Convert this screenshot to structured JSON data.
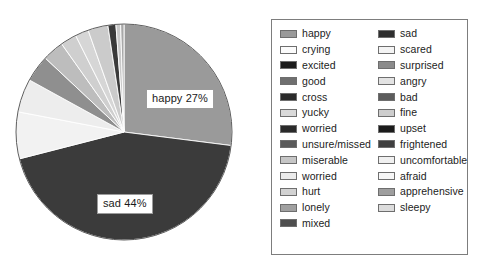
{
  "chart_data": {
    "type": "pie",
    "title": "",
    "xlabel": "",
    "ylabel": "",
    "legend_position": "right",
    "grid": false,
    "categories": [
      "happy",
      "sad",
      "crying",
      "scared",
      "excited",
      "surprised",
      "good",
      "angry",
      "cross",
      "bad",
      "yucky",
      "fine",
      "worried",
      "upset",
      "unsure/missed",
      "frightened",
      "miserable",
      "uncomfortable",
      "worried",
      "afraid",
      "hurt",
      "apprehensive",
      "lonely",
      "sleepy",
      "mixed"
    ],
    "values": [
      27,
      44,
      7,
      5,
      4,
      3,
      2.5,
      2,
      1.5,
      1.2,
      1,
      0.9,
      0.8,
      0.7,
      0.6,
      0.5,
      0.4,
      0.35,
      0.3,
      0.28,
      0.25,
      0.22,
      0.2,
      0.18,
      0.15
    ],
    "labels_shown": [
      {
        "text": "happy 27%",
        "category": "happy",
        "value": 27
      },
      {
        "text": "sad 44%",
        "category": "sad",
        "value": 44
      }
    ],
    "slices": [
      {
        "label": "happy",
        "percent": 27,
        "color": "#9a9a9a",
        "start_deg": 0,
        "end_deg": 97.2
      },
      {
        "label": "sad",
        "percent": 44,
        "color": "#3b3b3b",
        "start_deg": 97.2,
        "end_deg": 255.6
      },
      {
        "label": "crying",
        "percent": 7,
        "color": "#f2f2f2",
        "start_deg": 255.6,
        "end_deg": 280.8
      },
      {
        "label": "scared",
        "percent": 5,
        "color": "#ededed",
        "start_deg": 280.8,
        "end_deg": 298.8
      },
      {
        "label": "excited",
        "percent": 4,
        "color": "#8f8f8f",
        "start_deg": 298.8,
        "end_deg": 313.2
      },
      {
        "label": "surprised",
        "percent": 3.2,
        "color": "#bdbdbd",
        "start_deg": 313.2,
        "end_deg": 324.7
      },
      {
        "label": "good",
        "percent": 2.4,
        "color": "#cfcfcf",
        "start_deg": 324.7,
        "end_deg": 333.4
      },
      {
        "label": "angry",
        "percent": 2.0,
        "color": "#d6d6d6",
        "start_deg": 333.4,
        "end_deg": 340.6
      },
      {
        "label": "cross",
        "percent": 3.0,
        "color": "#cbcbcb",
        "start_deg": 340.6,
        "end_deg": 351.4
      },
      {
        "label": "bad",
        "percent": 1.2,
        "color": "#3a3a3a",
        "start_deg": 351.4,
        "end_deg": 355.7
      },
      {
        "label": "yucky",
        "percent": 0.7,
        "color": "#c9c9c9",
        "start_deg": 355.7,
        "end_deg": 358.2
      },
      {
        "label": "fine",
        "percent": 0.5,
        "color": "#a8a8a8",
        "start_deg": 358.2,
        "end_deg": 360.0
      }
    ],
    "pie_geometry": {
      "cx": 124,
      "cy": 132,
      "r": 108,
      "start_angle_deg": 0,
      "direction": "clockwise"
    }
  },
  "legend": {
    "left_column": [
      {
        "label": "happy",
        "color": "#9a9a9a"
      },
      {
        "label": "crying",
        "color": "#fbfbfb"
      },
      {
        "label": "excited",
        "color": "#1c1c1c"
      },
      {
        "label": "good",
        "color": "#6f6f6f"
      },
      {
        "label": "cross",
        "color": "#2b2b2b"
      },
      {
        "label": "yucky",
        "color": "#d9d9d9"
      },
      {
        "label": "worried",
        "color": "#2a2a2a"
      },
      {
        "label": "unsure/missed",
        "color": "#5a5a5a"
      },
      {
        "label": "miserable",
        "color": "#c6c6c6"
      },
      {
        "label": "worried",
        "color": "#ebebeb"
      },
      {
        "label": "hurt",
        "color": "#d2d2d2"
      },
      {
        "label": "lonely",
        "color": "#a0a0a0"
      },
      {
        "label": "mixed",
        "color": "#4e4e4e"
      }
    ],
    "right_column": [
      {
        "label": "sad",
        "color": "#2e2e2e"
      },
      {
        "label": "scared",
        "color": "#f4f4f4"
      },
      {
        "label": "surprised",
        "color": "#8b8b8b"
      },
      {
        "label": "angry",
        "color": "#e3e3e3"
      },
      {
        "label": "bad",
        "color": "#5c5c5c"
      },
      {
        "label": "fine",
        "color": "#cdcdcd"
      },
      {
        "label": "upset",
        "color": "#1b1b1b"
      },
      {
        "label": "frightened",
        "color": "#3f3f3f"
      },
      {
        "label": "uncomfortable",
        "color": "#f0f0f0"
      },
      {
        "label": "afraid",
        "color": "#f7f7f7"
      },
      {
        "label": "apprehensive",
        "color": "#9e9e9e"
      },
      {
        "label": "sleepy",
        "color": "#dcdcdc"
      }
    ]
  }
}
